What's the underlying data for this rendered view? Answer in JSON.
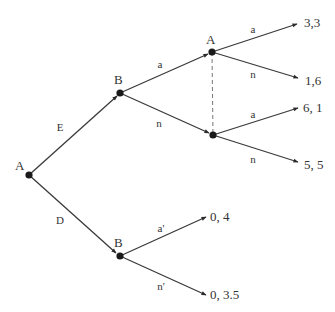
{
  "diagram": {
    "type": "extensive-form game tree",
    "nodes": [
      {
        "id": "root",
        "player": "A",
        "x": 29,
        "y": 175,
        "label_x": 15,
        "label_y": 170
      },
      {
        "id": "b1",
        "player": "B",
        "x": 120,
        "y": 93,
        "label_x": 114,
        "label_y": 84
      },
      {
        "id": "a2",
        "player": "A",
        "x": 212,
        "y": 52,
        "label_x": 206,
        "label_y": 44
      },
      {
        "id": "a3",
        "player": "",
        "x": 213,
        "y": 135,
        "label_x": 0,
        "label_y": 0
      },
      {
        "id": "b2",
        "player": "B",
        "x": 120,
        "y": 256,
        "label_x": 114,
        "label_y": 247
      }
    ],
    "edges": [
      {
        "from": "root",
        "to": "b1",
        "action": "E",
        "ex": 117,
        "ey": 96,
        "lx": 60,
        "ly": 131
      },
      {
        "from": "root",
        "to": "b2",
        "action": "D",
        "ex": 116,
        "ey": 253,
        "lx": 60,
        "ly": 224
      },
      {
        "from": "b1",
        "to": "a2",
        "action": "a",
        "ex": 208,
        "ey": 54,
        "lx": 160,
        "ly": 68
      },
      {
        "from": "b1",
        "to": "a3",
        "action": "n",
        "ex": 209,
        "ey": 133,
        "lx": 159,
        "ly": 127
      },
      {
        "from": "a2",
        "to": "t1",
        "action": "a",
        "ex": 297,
        "ey": 24,
        "lx": 253,
        "ly": 33
      },
      {
        "from": "a2",
        "to": "t2",
        "action": "n",
        "ex": 298,
        "ey": 78,
        "lx": 253,
        "ly": 78
      },
      {
        "from": "a3",
        "to": "t3",
        "action": "a",
        "ex": 298,
        "ey": 108,
        "lx": 253,
        "ly": 118
      },
      {
        "from": "a3",
        "to": "t4",
        "action": "n",
        "ex": 298,
        "ey": 162,
        "lx": 253,
        "ly": 163
      },
      {
        "from": "b2",
        "to": "t5",
        "action": "a'",
        "ex": 206,
        "ey": 217,
        "lx": 161,
        "ly": 232
      },
      {
        "from": "b2",
        "to": "t6",
        "action": "n'",
        "ex": 206,
        "ey": 295,
        "lx": 161,
        "ly": 290
      }
    ],
    "payoffs": [
      {
        "id": "t1",
        "text": "3,3",
        "x": 304,
        "y": 27
      },
      {
        "id": "t2",
        "text": "1,6",
        "x": 305,
        "y": 85
      },
      {
        "id": "t3",
        "text": "6, 1",
        "x": 303,
        "y": 112
      },
      {
        "id": "t4",
        "text": "5, 5",
        "x": 304,
        "y": 169
      },
      {
        "id": "t5",
        "text": "0, 4",
        "x": 210,
        "y": 221
      },
      {
        "id": "t6",
        "text": "0, 3.5",
        "x": 210,
        "y": 299
      }
    ],
    "information_set": {
      "from": "a2",
      "to": "a3",
      "style": "dashed"
    }
  }
}
